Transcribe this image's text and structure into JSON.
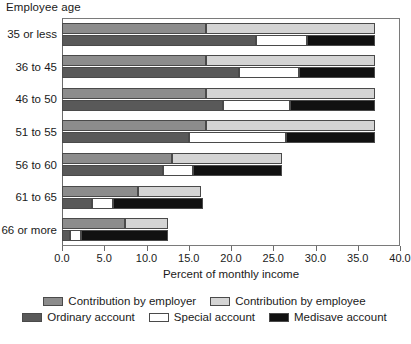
{
  "chart_data": {
    "type": "bar",
    "orientation": "horizontal",
    "title": "",
    "xlabel": "Percent of monthly income",
    "ylabel": "Employee age",
    "xlim": [
      0.0,
      40.0
    ],
    "xticks": [
      "0.0",
      "5.0",
      "10.0",
      "15.0",
      "20.0",
      "25.0",
      "30.0",
      "35.0",
      "40.0"
    ],
    "xtick_values": [
      0,
      5,
      10,
      15,
      20,
      25,
      30,
      35,
      40
    ],
    "grid": false,
    "legend_position": "bottom",
    "categories": [
      "35 or less",
      "36 to 45",
      "46 to 50",
      "51 to 55",
      "56 to 60",
      "61 to 65",
      "66 or more"
    ],
    "groups": [
      {
        "name": "Contribution source",
        "series": [
          {
            "name": "Contribution by employer",
            "color": "#8c8c8c",
            "values": [
              17.0,
              17.0,
              17.0,
              17.0,
              13.0,
              9.0,
              7.5
            ]
          },
          {
            "name": "Contribution by employee",
            "color": "#d4d4d4",
            "values": [
              20.0,
              20.0,
              20.0,
              20.0,
              13.0,
              7.5,
              5.0
            ]
          }
        ]
      },
      {
        "name": "Account allocation",
        "series": [
          {
            "name": "Ordinary account",
            "color": "#595959",
            "values": [
              23.0,
              21.0,
              19.0,
              15.0,
              12.0,
              3.5,
              1.0
            ]
          },
          {
            "name": "Special account",
            "color": "#ffffff",
            "values": [
              6.0,
              7.0,
              8.0,
              11.5,
              3.5,
              2.5,
              1.2
            ]
          },
          {
            "name": "Medisave account",
            "color": "#111111",
            "values": [
              8.0,
              9.0,
              10.0,
              10.5,
              10.5,
              10.7,
              10.3
            ]
          }
        ]
      }
    ],
    "totals": [
      37.0,
      37.0,
      37.0,
      37.0,
      26.0,
      16.7,
      12.5
    ]
  },
  "legend": {
    "rows": [
      [
        {
          "label": "Contribution by employer",
          "color": "#8c8c8c",
          "swatch": "legend-swatch-employer"
        },
        {
          "label": "Contribution by employee",
          "color": "#d4d4d4",
          "swatch": "legend-swatch-employee"
        }
      ],
      [
        {
          "label": "Ordinary account",
          "color": "#595959",
          "swatch": "legend-swatch-ordinary"
        },
        {
          "label": "Special account",
          "color": "#ffffff",
          "swatch": "legend-swatch-special"
        },
        {
          "label": "Medisave account",
          "color": "#111111",
          "swatch": "legend-swatch-medisave"
        }
      ]
    ]
  }
}
